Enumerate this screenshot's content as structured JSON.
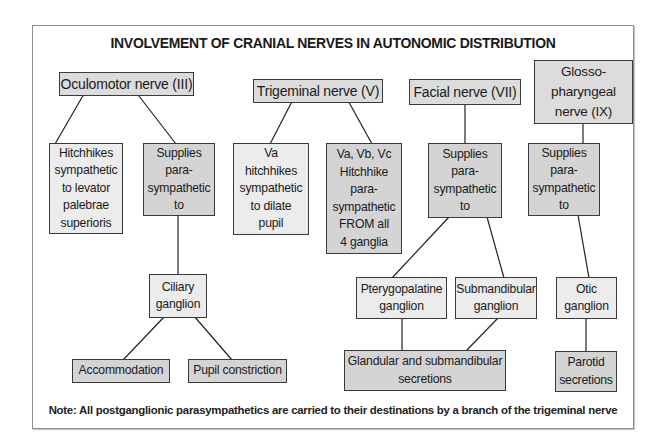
{
  "title": "INVOLVEMENT OF CRANIAL NERVES IN AUTONOMIC DISTRIBUTION",
  "nerves": {
    "oculomotor": "Oculomotor nerve (III)",
    "trigeminal": "Trigeminal nerve (V)",
    "facial": "Facial nerve (VII)",
    "glossopharyngeal": "Glosso-\npharyngeal\nnerve (IX)"
  },
  "oculomotor_branch": {
    "sympathetic": "Hitchhikes\nsympathetic\nto levator\npalebrae\nsuperioris",
    "parasympathetic": "Supplies\npara-\nsympathetic\nto",
    "ganglion": "Ciliary\nganglion",
    "effects": [
      "Accommodation",
      "Pupil constriction"
    ]
  },
  "trigeminal_branch": {
    "va": "Va\nhitchhikes\nsympathetic\nto dilate\npupil",
    "vabc": "Va, Vb, Vc\nHitchhike\npara-\nsympathetic\nFROM all\n4 ganglia"
  },
  "facial_branch": {
    "parasympathetic": "Supplies\npara-\nsympathetic\nto",
    "ganglia": [
      "Pterygopalatine\nganglion",
      "Submandibular\nganglion"
    ],
    "effect": "Glandular and submandibular\nsecretions"
  },
  "glossopharyngeal_branch": {
    "parasympathetic": "Supplies\npara-\nsympathetic\nto",
    "ganglion": "Otic\nganglion",
    "effect": "Parotid\nsecretions"
  },
  "note": "Note: All postganglionic parasympathetics are carried to their destinations by a branch of the trigeminal nerve",
  "colors": {
    "border": "#3a3a3a",
    "light_fill": "#ececec",
    "mid_fill": "#d4d4d4",
    "frame": "#8c8c8c"
  }
}
